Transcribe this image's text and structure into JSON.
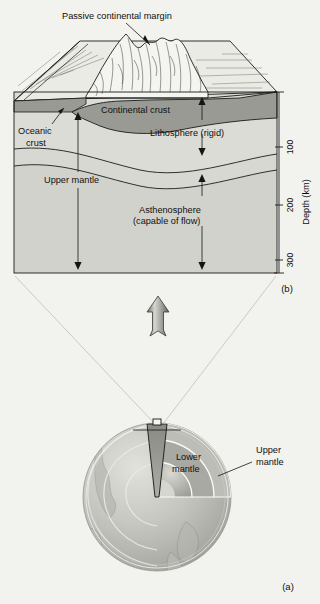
{
  "figure": {
    "background_color": "#f2f2ef",
    "panels": [
      {
        "id": "b",
        "label": "(b)",
        "caption_role": "block-diagram-passive-margin"
      },
      {
        "id": "a",
        "label": "(a)",
        "caption_role": "earth-cutaway-globe"
      }
    ]
  },
  "block_diagram": {
    "labels": {
      "passive_margin": "Passive continental margin",
      "continental_crust": "Continental crust",
      "oceanic_crust_line1": "Oceanic",
      "oceanic_crust_line2": "crust",
      "lithosphere": "Lithosphere (rigid)",
      "upper_mantle": "Upper mantle",
      "asthenosphere_line1": "Asthenosphere",
      "asthenosphere_line2": "(capable of flow)"
    },
    "depth_axis": {
      "title": "Depth (km)",
      "unit": "km",
      "ticks": [
        "100",
        "200",
        "300"
      ],
      "range_top": "0",
      "range_bottom": "300"
    },
    "panel_label": "(b)",
    "colors": {
      "continental_crust_fill": "#9a9a95",
      "mantle_fill": "#dcdcd7",
      "asthenosphere_fill": "#d2d2cd",
      "block_top_fill": "#ebebe6",
      "outline": "#1b1b1b"
    }
  },
  "globe_diagram": {
    "labels": {
      "lower_mantle_line1": "Lower",
      "lower_mantle_line2": "mantle",
      "upper_mantle_line1": "Upper",
      "upper_mantle_line2": "mantle"
    },
    "panel_label": "(a)",
    "colors": {
      "surface": "#c9c9c4",
      "ocean": "#bdbdb8",
      "lower_mantle": "#b0b0ab",
      "outer_core": "#a0a09b",
      "inner_core": "#d8d8d3",
      "wedge": "#8e8e89"
    }
  },
  "connector": {
    "arrow_icon": "up-arrow-icon",
    "arrow_direction": "up",
    "ray_count": "2"
  }
}
